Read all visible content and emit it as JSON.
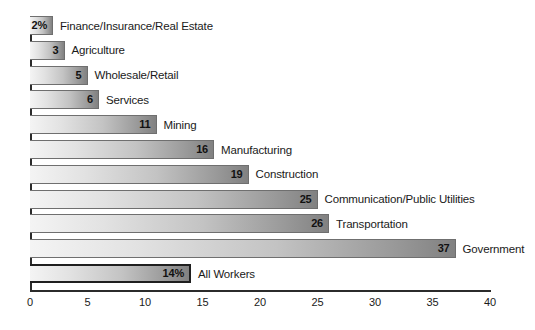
{
  "chart_data": {
    "type": "bar",
    "orientation": "horizontal",
    "title": "",
    "subtitle": "",
    "xlabel": "",
    "ylabel": "",
    "xlim": [
      0,
      40
    ],
    "grid": false,
    "legend": null,
    "unit": "percent",
    "ticks": [
      "0",
      "5",
      "10",
      "15",
      "20",
      "25",
      "30",
      "35",
      "40"
    ],
    "tick_values": [
      0,
      5,
      10,
      15,
      20,
      25,
      30,
      35,
      40
    ],
    "categories": [
      "Finance/Insurance/Real Estate",
      "Agriculture",
      "Wholesale/Retail",
      "Services",
      "Mining",
      "Manufacturing",
      "Construction",
      "Communication/Public Utilities",
      "Transportation",
      "Government",
      "All Workers"
    ],
    "values": [
      2,
      3,
      5,
      6,
      11,
      16,
      19,
      25,
      26,
      37,
      14
    ],
    "value_labels": [
      "2%",
      "3",
      "5",
      "6",
      "11",
      "16",
      "19",
      "25",
      "26",
      "37",
      "14%"
    ],
    "highlight_indices": [
      10
    ],
    "bars": [
      {
        "label": "Finance/Insurance/Real Estate",
        "value": 2,
        "value_label": "2%",
        "highlight": false
      },
      {
        "label": "Agriculture",
        "value": 3,
        "value_label": "3",
        "highlight": false
      },
      {
        "label": "Wholesale/Retail",
        "value": 5,
        "value_label": "5",
        "highlight": false
      },
      {
        "label": "Services",
        "value": 6,
        "value_label": "6",
        "highlight": false
      },
      {
        "label": "Mining",
        "value": 11,
        "value_label": "11",
        "highlight": false
      },
      {
        "label": "Manufacturing",
        "value": 16,
        "value_label": "16",
        "highlight": false
      },
      {
        "label": "Construction",
        "value": 19,
        "value_label": "19",
        "highlight": false
      },
      {
        "label": "Communication/Public Utilities",
        "value": 25,
        "value_label": "25",
        "highlight": false
      },
      {
        "label": "Transportation",
        "value": 26,
        "value_label": "26",
        "highlight": false
      },
      {
        "label": "Government",
        "value": 37,
        "value_label": "37",
        "highlight": false
      },
      {
        "label": "All Workers",
        "value": 14,
        "value_label": "14%",
        "highlight": true
      }
    ],
    "colors": {
      "bar_gradient_start": "#f4f4f4",
      "bar_gradient_end": "#818181",
      "bar_border": "#6f6f6f",
      "highlight_border": "#1f1f1f",
      "axis": "#2b2b2b",
      "text": "#1a1a1a",
      "background": "#ffffff"
    }
  }
}
